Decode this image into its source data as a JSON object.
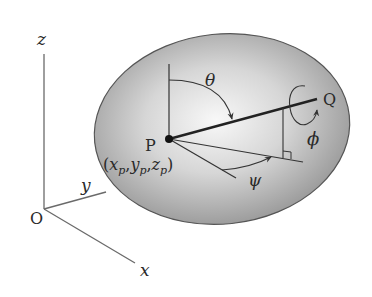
{
  "figure": {
    "colors": {
      "background": "#ffffff",
      "ellipse_center": "#f7f7f7",
      "ellipse_edge": "#8e8e8e",
      "ellipse_outline": "#555555",
      "lines": "#333333",
      "axes": "#6a6a6a",
      "text": "#2a2a2a"
    },
    "axes": {
      "origin_label": "O",
      "x_label": "x",
      "y_label": "y",
      "z_label": "z"
    },
    "points": {
      "p_label": "P",
      "q_label": "Q",
      "p_coords": {
        "open": "(",
        "x": "x",
        "x_sub": "p",
        "sep1": ",",
        "y": "y",
        "y_sub": "p",
        "sep2": ",",
        "z": "z",
        "z_sub": "p",
        "close": ")"
      }
    },
    "angles": {
      "theta": "θ",
      "psi": "ψ",
      "phi": "ϕ"
    }
  }
}
